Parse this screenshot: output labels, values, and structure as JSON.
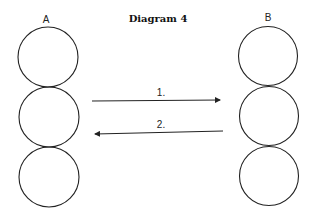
{
  "title": "Diagram 4",
  "columns": [
    {
      "label": "A",
      "cx": 48,
      "circles": [
        57,
        117,
        177
      ],
      "r": 30
    },
    {
      "label": "B",
      "cx": 269,
      "circles": [
        57,
        117,
        176
      ],
      "r": 29.5
    }
  ],
  "arrows": [
    {
      "label": "1.",
      "direction": "A-to-B",
      "x1": 92,
      "y1": 101,
      "x2": 221,
      "y2": 100
    },
    {
      "label": "2.",
      "direction": "B-to-A",
      "x1": 223,
      "y1": 131,
      "x2": 94,
      "y2": 134
    }
  ],
  "colors": {
    "stroke": "#222222",
    "background": "#ffffff"
  }
}
